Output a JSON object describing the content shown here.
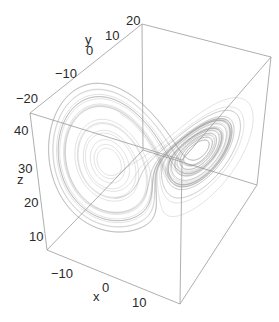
{
  "chart_data": {
    "type": "line3d",
    "axes": {
      "x": {
        "label": "x",
        "ticks": [
          "-10",
          "0",
          "10"
        ],
        "range": [
          -20,
          20
        ]
      },
      "y": {
        "label": "y",
        "ticks": [
          "-20",
          "-10",
          "0",
          "10",
          "20"
        ],
        "range": [
          -25,
          25
        ]
      },
      "z": {
        "label": "z",
        "ticks": [
          "10",
          "20",
          "30",
          "40"
        ],
        "range": [
          5,
          48
        ]
      }
    },
    "series": [
      {
        "name": "trajectory",
        "color": "#8c8c8c"
      }
    ],
    "box": true,
    "grid": false,
    "legend": "none"
  },
  "labels": {
    "x": "x",
    "y": "y",
    "z": "z",
    "x_ticks": [
      "-10",
      "0",
      "10"
    ],
    "y_ticks": [
      "-20",
      "-10",
      "0",
      "10",
      "20"
    ],
    "z_ticks": [
      "10",
      "20",
      "30",
      "40"
    ]
  },
  "colors": {
    "box_edge": "#9a9a9a",
    "trajectory": "#8c8c8c",
    "text": "#2a2a2a",
    "background": "#ffffff"
  }
}
